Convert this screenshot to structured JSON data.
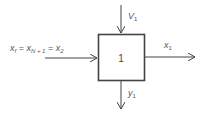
{
  "diagram": {
    "block": {
      "label": "1"
    },
    "inputs": {
      "left": {
        "var": "x",
        "sub": "f",
        "eq1": "x",
        "eq1_sub": "N + 1",
        "eq2": "x",
        "eq2_sub": "2"
      },
      "top": {
        "var": "V",
        "sub": "1"
      }
    },
    "outputs": {
      "right": {
        "var": "x",
        "sub": "1"
      },
      "bottom": {
        "var": "y",
        "sub": "1"
      }
    },
    "colors": {
      "stroke": "#444444",
      "text": "#555555"
    }
  }
}
